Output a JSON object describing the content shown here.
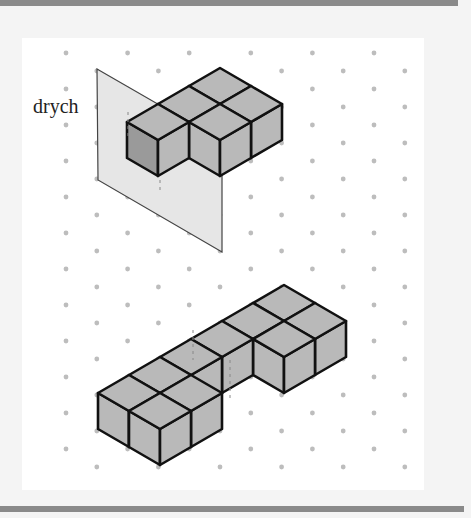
{
  "figure": {
    "label": "drych",
    "colors": {
      "background": "#ffffff",
      "frame": "#f4f4f4",
      "border_bar": "#8a8a8a",
      "dot": "#bdbdbd",
      "cube_face": "#b9b9b9",
      "cube_face_shaded": "#9a9a9a",
      "edge": "#111111",
      "mirror": "#e6e6e6"
    },
    "grid": {
      "type": "isometric-dot",
      "unit_right_down": [
        31,
        18
      ],
      "unit_left_down": [
        -31,
        18
      ],
      "unit_up": [
        0,
        -36
      ]
    },
    "mirror_plane": [
      [
        97,
        69
      ],
      [
        222,
        141
      ],
      [
        222,
        252
      ],
      [
        98,
        180
      ]
    ],
    "shapes": [
      {
        "name": "original-shape",
        "origin": [
          220,
          68
        ],
        "cubes": [
          [
            0,
            0
          ],
          [
            1,
            0
          ],
          [
            0,
            1
          ],
          [
            1,
            1
          ],
          [
            0,
            2
          ]
        ],
        "shaded_face_cube": [
          0,
          2
        ]
      },
      {
        "name": "reflected-shape",
        "origin": [
          284,
          285
        ],
        "cubes": [
          [
            0,
            0
          ],
          [
            1,
            0
          ],
          [
            0,
            1
          ],
          [
            1,
            1
          ],
          [
            0,
            2
          ],
          [
            0,
            3
          ],
          [
            0,
            4
          ],
          [
            0,
            5
          ],
          [
            1,
            4
          ],
          [
            1,
            5
          ]
        ]
      }
    ]
  }
}
